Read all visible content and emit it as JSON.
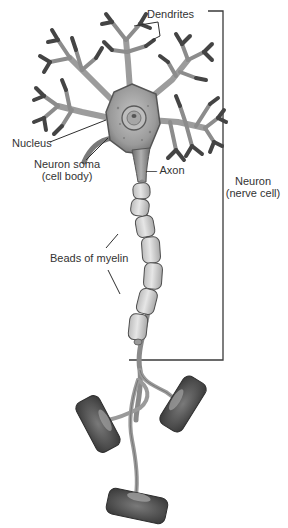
{
  "diagram": {
    "labels": {
      "dendrites": "Dendrites",
      "nucleus": "Nucleus",
      "soma_line1": "Neuron soma",
      "soma_line2": "(cell body)",
      "axon": "— Axon",
      "neuron_line1": "Neuron",
      "neuron_line2": "(nerve cell)",
      "myelin": "Beads of myelin"
    },
    "bracket": {
      "covers": "Neuron (nerve cell)",
      "top_y": 11,
      "bottom_y": 360,
      "x": 223
    },
    "colors": {
      "background": "#ffffff",
      "text": "#333333",
      "leader_line": "#333333",
      "dendrite_dark": "#4a4a4a",
      "dendrite_light": "#a8a8a8",
      "soma": "#9a9a9a",
      "myelin": "#d6d6d6",
      "terminal": "#5a5a5a"
    },
    "parts": [
      "dendrites",
      "nucleus",
      "neuron soma",
      "axon",
      "beads of myelin",
      "axon terminals"
    ]
  }
}
